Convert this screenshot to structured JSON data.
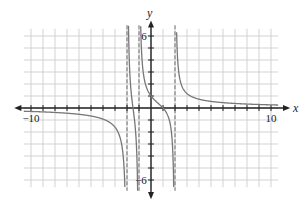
{
  "chart_data": {
    "type": "line",
    "title": "",
    "xlabel": "x",
    "ylabel": "y",
    "xlim": [
      -11,
      11
    ],
    "ylim": [
      -7,
      7
    ],
    "grid": true,
    "grid_step": 1,
    "tick_labels": {
      "x": [
        {
          "value": -10,
          "label": "−10"
        },
        {
          "value": 10,
          "label": "10"
        }
      ],
      "y": [
        {
          "value": 6,
          "label": "6"
        },
        {
          "value": -6,
          "label": "−6"
        }
      ]
    },
    "vertical_asymptotes": [
      -2,
      -1,
      2
    ],
    "horizontal_asymptote": 0,
    "intercepts": {
      "x_intercept": 1,
      "y_intercept": 1
    },
    "series": [
      {
        "name": "f(x)",
        "description": "rational function with vertical asymptotes at x=-2, x=-1, x=2",
        "sample_points": [
          {
            "x": -10,
            "y": -0.3
          },
          {
            "x": -5,
            "y": -0.6
          },
          {
            "x": -3,
            "y": -1.7
          },
          {
            "x": -2.2,
            "y": -6
          },
          {
            "x": -1.8,
            "y": 6
          },
          {
            "x": -1.5,
            "y": 0
          },
          {
            "x": -1.2,
            "y": -6
          },
          {
            "x": -0.8,
            "y": 6
          },
          {
            "x": 0,
            "y": 1
          },
          {
            "x": 1,
            "y": 0
          },
          {
            "x": 1.8,
            "y": -6
          },
          {
            "x": 2.2,
            "y": 6
          },
          {
            "x": 3,
            "y": 1.5
          },
          {
            "x": 5,
            "y": 0.6
          },
          {
            "x": 10,
            "y": 0.2
          }
        ]
      }
    ],
    "colors": {
      "curve": "#777777",
      "grid": "#c8c8c8",
      "axis": "#222222",
      "asymptote": "#888888"
    }
  }
}
